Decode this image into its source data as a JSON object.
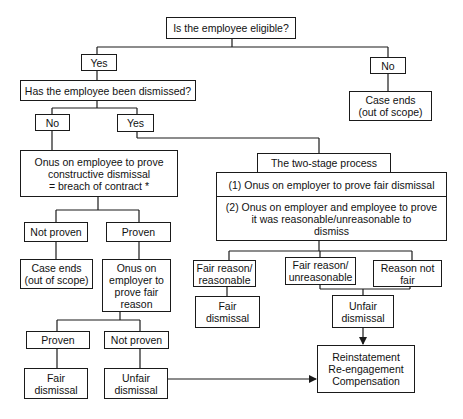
{
  "diagram": {
    "type": "flowchart",
    "nodes": {
      "eligible": "Is the employee eligible?",
      "yes1": "Yes",
      "no1": "No",
      "case_ends_right": "Case ends\n(out of scope)",
      "dismissed": "Has the employee been dismissed?",
      "no2": "No",
      "yes2": "Yes",
      "onus_employee": "Onus on employee to prove\nconstructive dismissal\n= breach of contract *",
      "not_proven1": "Not proven",
      "proven1": "Proven",
      "case_ends_left": "Case ends\n(out of scope)",
      "onus_employer": "Onus on\nemployer to\nprove fair\nreason",
      "proven2": "Proven",
      "not_proven2": "Not proven",
      "fair_dismissal_left": "Fair\ndismissal",
      "unfair_dismissal_left": "Unfair\ndismissal",
      "two_stage_title": "The two-stage process",
      "stage1": "(1) Onus on employer to prove fair dismissal",
      "stage2": "(2) Onus on employer and employee to prove\nit was reasonable/unreasonable to\ndismiss",
      "fair_reasonable": "Fair reason/\nreasonable",
      "fair_unreasonable": "Fair reason/\nunreasonable",
      "reason_not_fair": "Reason not\nfair",
      "fair_dismissal_right": "Fair\ndismissal",
      "unfair_dismissal_right": "Unfair\ndismissal",
      "remedies": "Reinstatement\nRe-engagement\nCompensation"
    },
    "colors": {
      "line": "#1a1a1a",
      "background": "#ffffff"
    }
  }
}
